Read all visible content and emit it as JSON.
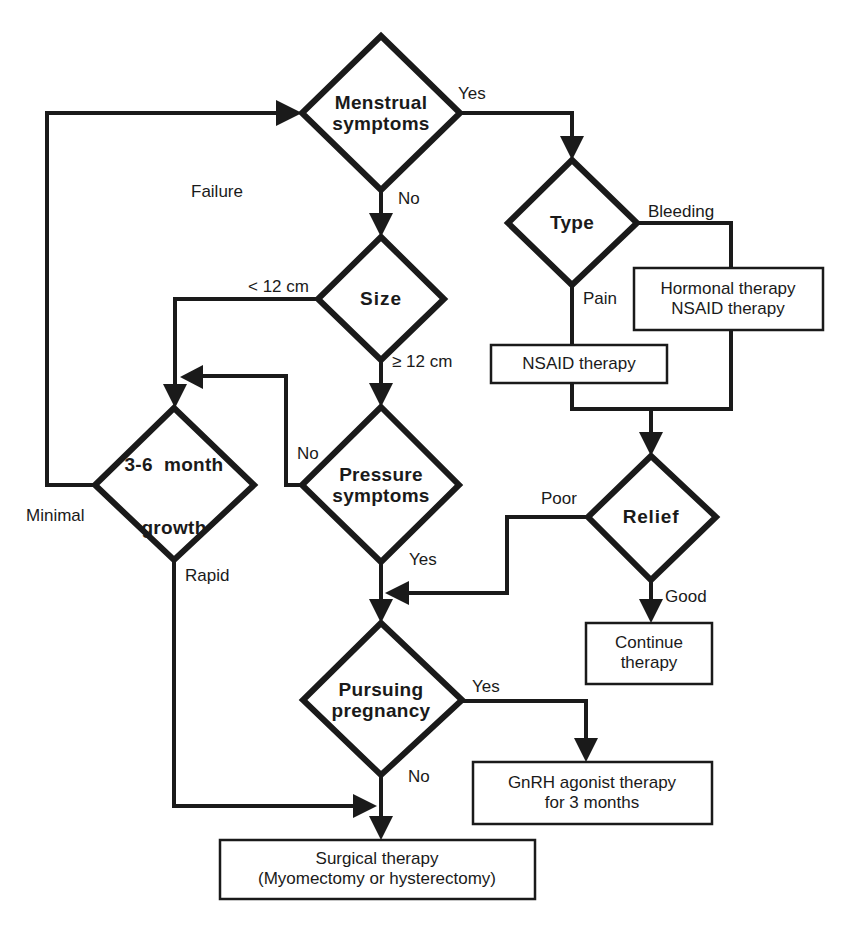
{
  "diagram": {
    "decisions": {
      "menstrual": {
        "label_line1": "Menstrual",
        "label_line2": "symptoms"
      },
      "type": {
        "label": "Type"
      },
      "size": {
        "label": "Size"
      },
      "pressure": {
        "label_line1": "Pressure",
        "label_line2": "symptoms"
      },
      "growth": {
        "label_line1": "3-6  month",
        "label_line2": "growth"
      },
      "relief": {
        "label": "Relief"
      },
      "pregnancy": {
        "label_line1": "Pursuing",
        "label_line2": "pregnancy"
      }
    },
    "actions": {
      "hormonal": {
        "line1": "Hormonal therapy",
        "line2": "NSAID therapy"
      },
      "nsaid": {
        "line1": "NSAID therapy"
      },
      "continue": {
        "line1": "Continue",
        "line2": "therapy"
      },
      "gnrh": {
        "line1": "GnRH agonist therapy",
        "line2": "for 3 months"
      },
      "surgical": {
        "line1": "Surgical therapy",
        "line2": "(Myomectomy or hysterectomy)"
      }
    },
    "edge_labels": {
      "menstrual_yes": "Yes",
      "menstrual_no": "No",
      "failure": "Failure",
      "type_bleeding": "Bleeding",
      "type_pain": "Pain",
      "size_lt": "< 12 cm",
      "size_ge": "≥ 12 cm",
      "pressure_no": "No",
      "pressure_yes": "Yes",
      "growth_minimal": "Minimal",
      "growth_rapid": "Rapid",
      "relief_poor": "Poor",
      "relief_good": "Good",
      "pregnancy_yes": "Yes",
      "pregnancy_no": "No"
    }
  }
}
